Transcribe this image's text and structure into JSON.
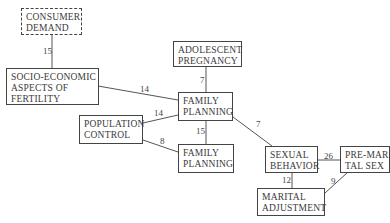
{
  "nodes": {
    "consumer_demand": {
      "lines": [
        "CONSUMER",
        "DEMAND"
      ],
      "style": "dashed"
    },
    "socio_economic": {
      "lines": [
        "SOCIO-ECONOMIC",
        "ASPECTS OF",
        "FERTILITY"
      ]
    },
    "adolescent_pregnancy": {
      "lines": [
        "ADOLESCENT",
        "PREGNANCY"
      ]
    },
    "family_planning_1": {
      "lines": [
        "FAMILY",
        "PLANNING"
      ]
    },
    "population_control": {
      "lines": [
        "POPULATION",
        "CONTROL"
      ]
    },
    "family_planning_2": {
      "lines": [
        "FAMILY",
        "PLANNING"
      ]
    },
    "sexual_behavior": {
      "lines": [
        "SEXUAL",
        "BEHAVIOR"
      ]
    },
    "pre_marital_sex": {
      "lines": [
        "PRE-MARI-",
        "TAL SEX"
      ]
    },
    "marital_adjustment": {
      "lines": [
        "MARITAL",
        "ADJUSTMENT"
      ]
    }
  },
  "edges": [
    {
      "from": "consumer_demand",
      "to": "socio_economic",
      "weight": "15"
    },
    {
      "from": "socio_economic",
      "to": "family_planning_1",
      "weight": "14"
    },
    {
      "from": "adolescent_pregnancy",
      "to": "family_planning_1",
      "weight": "7"
    },
    {
      "from": "population_control",
      "to": "family_planning_1",
      "weight": "14"
    },
    {
      "from": "population_control",
      "to": "family_planning_2",
      "weight": "8"
    },
    {
      "from": "family_planning_1",
      "to": "family_planning_2",
      "weight": "15"
    },
    {
      "from": "family_planning_1",
      "to": "sexual_behavior",
      "weight": "7"
    },
    {
      "from": "sexual_behavior",
      "to": "pre_marital_sex",
      "weight": "26"
    },
    {
      "from": "sexual_behavior",
      "to": "marital_adjustment",
      "weight": "12"
    },
    {
      "from": "pre_marital_sex",
      "to": "marital_adjustment",
      "weight": "9"
    }
  ]
}
